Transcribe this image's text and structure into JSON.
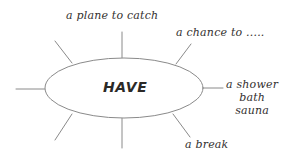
{
  "diagram": {
    "type": "word-web",
    "title": "HAVE",
    "center": {
      "label": "HAVE",
      "shape": "ellipse",
      "cx": 124,
      "cy": 88,
      "rx": 79,
      "ry": 30
    },
    "style": {
      "background": "#ffffff",
      "line_color": "#8a8a8a",
      "text_color": "#33302f",
      "center_text_color": "#2b2927"
    },
    "spokes": [
      {
        "name": "plane",
        "label": "a plane to catch",
        "direction": "up",
        "x1": 122,
        "y1": 58,
        "x2": 122,
        "y2": 32
      },
      {
        "name": "chance",
        "label": "a chance to .....",
        "direction": "up-right",
        "x1": 176,
        "y1": 64,
        "x2": 191,
        "y2": 44
      },
      {
        "name": "shower",
        "label": "a shower bath sauna",
        "label_lines": [
          "a shower",
          "bath",
          "sauna"
        ],
        "direction": "right",
        "x1": 203,
        "y1": 88,
        "x2": 223,
        "y2": 88
      },
      {
        "name": "break",
        "label": "a break",
        "direction": "down-right",
        "x1": 173,
        "y1": 114,
        "x2": 190,
        "y2": 137
      },
      {
        "name": "blank-bottom",
        "label": "",
        "direction": "down",
        "x1": 122,
        "y1": 118,
        "x2": 122,
        "y2": 148
      },
      {
        "name": "blank-bottom-left",
        "label": "",
        "direction": "down-left",
        "x1": 72,
        "y1": 114,
        "x2": 55,
        "y2": 140
      },
      {
        "name": "blank-left",
        "label": "",
        "direction": "left",
        "x1": 45,
        "y1": 89,
        "x2": 16,
        "y2": 89
      },
      {
        "name": "blank-top-left",
        "label": "",
        "direction": "up-left",
        "x1": 72,
        "y1": 63,
        "x2": 55,
        "y2": 41
      }
    ]
  }
}
